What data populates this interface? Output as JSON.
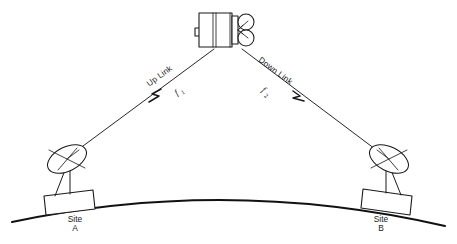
{
  "diagram": {
    "background_color": "#ffffff",
    "line_color": "#1a1a1a"
  },
  "satellite": {
    "name": "communications-satellite",
    "body_label": "",
    "reflector_count": 2
  },
  "links": {
    "uplink": {
      "label": "Up Link",
      "frequency_symbol": "f",
      "frequency_subscript": "1",
      "direction": "site-a-to-satellite"
    },
    "downlink": {
      "label": "Down Link",
      "frequency_symbol": "f",
      "frequency_subscript": "2",
      "direction": "satellite-to-site-b"
    }
  },
  "ground_stations": [
    {
      "name": "site-a",
      "label_line1": "Site",
      "label_line2": "A",
      "role": "transmitting-earth-station"
    },
    {
      "name": "site-b",
      "label_line1": "Site",
      "label_line2": "B",
      "role": "receiving-earth-station"
    }
  ],
  "earth": {
    "name": "earth-surface-arc",
    "label": ""
  }
}
